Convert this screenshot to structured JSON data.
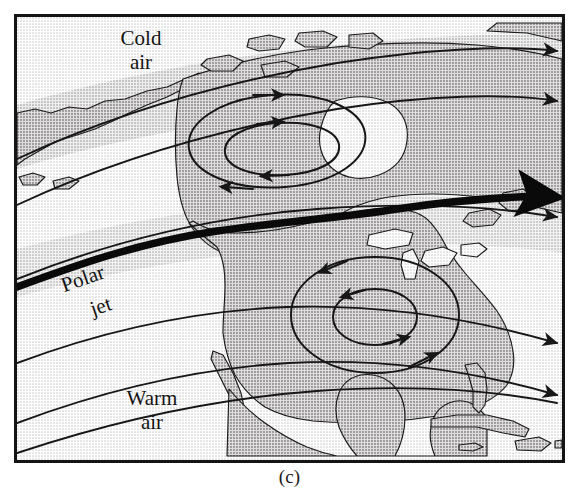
{
  "figure": {
    "caption": "(c)",
    "title_semantic": "polar-jet-stream-over-north-america",
    "type": "weather-map-diagram"
  },
  "labels": {
    "cold_air_line1": "Cold",
    "cold_air_line2": "air",
    "warm_air_line1": "Warm",
    "warm_air_line2": "air",
    "polar_jet_line1": "Polar",
    "polar_jet_line2": "jet"
  },
  "colors": {
    "frame_border": "#141414",
    "ocean_fill": "#ebe9e9",
    "land_fill": "#b9b7b7",
    "band_fill": "#c9c7c7",
    "contour_stroke": "#171717",
    "jet_stroke": "#0a0a0a",
    "coastline_stroke": "#1c1c1c",
    "page_background": "#ffffff",
    "text": "#131313"
  },
  "map_features": {
    "landmasses": [
      "North America",
      "Canadian Arctic Archipelago",
      "Greenland edge",
      "Alaska",
      "Baja California",
      "Mexico",
      "Central America",
      "Florida",
      "Cuba",
      "Jamaica",
      "Hispaniola",
      "Newfoundland"
    ],
    "water_bodies": [
      "Pacific Ocean",
      "Atlantic Ocean",
      "Gulf of Mexico",
      "Hudson Bay",
      "Great Lakes",
      "Caribbean Sea"
    ]
  },
  "flow": {
    "jet_label": "Polar jet",
    "jet_direction": "west-to-east",
    "jet_line_weight_px": 6,
    "contour_count": 6,
    "contour_direction": "west-to-east",
    "circulations": [
      {
        "name": "northern-closed-low",
        "rotation": "counterclockwise",
        "ring_count": 2,
        "center_x": 278,
        "center_y": 128
      },
      {
        "name": "southern-closed-low",
        "rotation": "counterclockwise",
        "ring_count": 2,
        "center_x": 358,
        "center_y": 304
      }
    ],
    "air_masses": [
      {
        "name": "cold-air",
        "position": "north-of-jet",
        "label": "Cold air"
      },
      {
        "name": "warm-air",
        "position": "south-of-jet",
        "label": "Warm air"
      }
    ]
  }
}
